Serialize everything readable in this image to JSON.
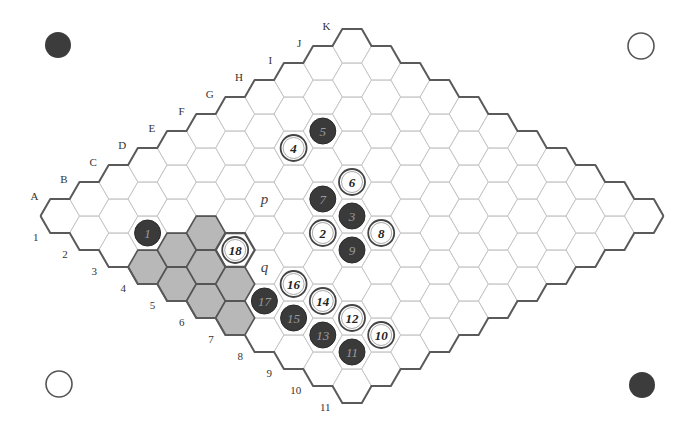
{
  "board": {
    "size": 11,
    "columns": [
      "A",
      "B",
      "C",
      "D",
      "E",
      "F",
      "G",
      "H",
      "I",
      "J",
      "K"
    ],
    "rows": [
      "1",
      "2",
      "3",
      "4",
      "5",
      "6",
      "7",
      "8",
      "9",
      "10",
      "11"
    ],
    "origin": {
      "x": 60,
      "y": 216
    },
    "hex_side": 19.5,
    "step": {
      "dx": 29.2,
      "dy": 17
    }
  },
  "colors": {
    "black_stone": "#3a3a3a",
    "white_stone": "#ffffff",
    "shaded_cell": "#b8b8b8",
    "grid_line": "#c4c4c4",
    "edge_line": "#5a5a5a"
  },
  "corner_stones": [
    {
      "position": "top-left",
      "color": "black",
      "x": 58,
      "y": 45
    },
    {
      "position": "top-right",
      "color": "white",
      "x": 641,
      "y": 46
    },
    {
      "position": "bottom-left",
      "color": "white",
      "x": 59,
      "y": 384
    },
    {
      "position": "bottom-right",
      "color": "black",
      "x": 642,
      "y": 385
    }
  ],
  "moves": [
    {
      "n": "1",
      "cell": "B3",
      "color": "black"
    },
    {
      "n": "2",
      "cell": "E6",
      "color": "white"
    },
    {
      "n": "3",
      "cell": "F6",
      "color": "black"
    },
    {
      "n": "4",
      "cell": "G3",
      "color": "white"
    },
    {
      "n": "5",
      "cell": "H3",
      "color": "black"
    },
    {
      "n": "6",
      "cell": "G5",
      "color": "white"
    },
    {
      "n": "7",
      "cell": "F5",
      "color": "black"
    },
    {
      "n": "8",
      "cell": "F7",
      "color": "white"
    },
    {
      "n": "9",
      "cell": "E7",
      "color": "black"
    },
    {
      "n": "10",
      "cell": "C10",
      "color": "white"
    },
    {
      "n": "11",
      "cell": "B10",
      "color": "black"
    },
    {
      "n": "12",
      "cell": "C9",
      "color": "white"
    },
    {
      "n": "13",
      "cell": "B9",
      "color": "black"
    },
    {
      "n": "14",
      "cell": "C8",
      "color": "white"
    },
    {
      "n": "15",
      "cell": "B8",
      "color": "black"
    },
    {
      "n": "16",
      "cell": "C7",
      "color": "white"
    },
    {
      "n": "17",
      "cell": "B7",
      "color": "black"
    },
    {
      "n": "18",
      "cell": "C5",
      "color": "white"
    }
  ],
  "highlighted_cell": "C5",
  "shaded_cells": [
    "C4",
    "B4",
    "A4",
    "B5",
    "A5",
    "B6",
    "A6",
    "A7"
  ],
  "markers": [
    {
      "label": "p",
      "cell": "E4"
    },
    {
      "label": "q",
      "cell": "C6"
    }
  ]
}
